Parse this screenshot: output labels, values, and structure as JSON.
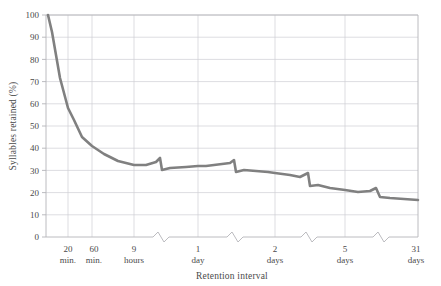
{
  "chart_data": {
    "type": "line",
    "title": "",
    "xlabel": "Retention interval",
    "ylabel": "Syllables retained (%)",
    "ylim": [
      0,
      100
    ],
    "yticks": [
      0,
      10,
      20,
      30,
      40,
      50,
      60,
      70,
      80,
      90,
      100
    ],
    "ytick_labels": [
      "0",
      "10",
      "20",
      "30",
      "40",
      "50",
      "60",
      "70",
      "80",
      "90",
      "100"
    ],
    "xtick_labels": [
      {
        "line1": "20",
        "line2": "min."
      },
      {
        "line1": "60",
        "line2": "min."
      },
      {
        "line1": "9",
        "line2": "hours"
      },
      {
        "line1": "1",
        "line2": "day"
      },
      {
        "line1": "2",
        "line2": "days"
      },
      {
        "line1": "5",
        "line2": "days"
      },
      {
        "line1": "31",
        "line2": "days"
      }
    ],
    "grid": true,
    "legend": "none",
    "series": [
      {
        "name": "Syllables retained",
        "color": "#808080",
        "x": [
          "0 min",
          "20 min",
          "60 min",
          "9 hours",
          "1 day",
          "2 days",
          "5 days",
          "31 days"
        ],
        "values": [
          100,
          58,
          44,
          36,
          34,
          32,
          28,
          24
        ]
      }
    ],
    "annotations": [
      "axis break between 9 hours and 1 day",
      "axis break between 1 day and 2 days",
      "axis break between 2 days and 5 days",
      "axis break between 5 days and 31 days"
    ]
  },
  "geometry": {
    "plot_left": 46,
    "plot_right": 418,
    "plot_top": 15,
    "plot_bottom": 237,
    "gridline_x": [
      68,
      92,
      134,
      198,
      275,
      345,
      418
    ],
    "break_x": [
      160,
      234,
      308,
      380
    ],
    "curve_points": "48,15 52,32 60,78 68,108 74,120 82,137 92,146 104,154 118,161 134,165 146,165 156,162 160,158 162,170 170,168 186,167 198,166 206,166 222,164 230,163 234,160 236,172 244,170 256,171 268,172 275,173 290,175 300,177 308,173 310,186 318,185 330,188 345,190 358,192 370,191 376,188 380,197 390,198 404,199 418,200"
  },
  "colors": {
    "line": "#808080",
    "grid": "#cfcfd4",
    "axis": "#a9a9ae",
    "text": "#4a4a4a",
    "background": "#ffffff"
  }
}
